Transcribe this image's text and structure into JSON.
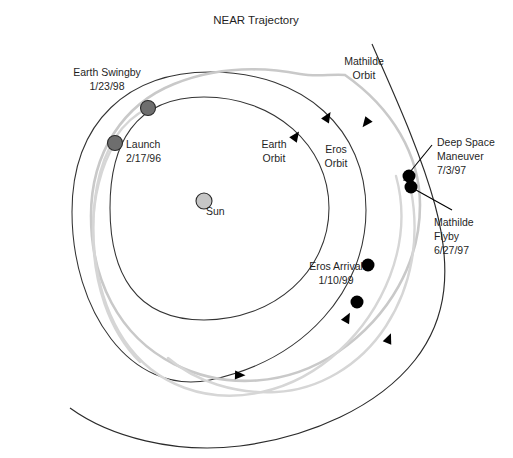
{
  "figure": {
    "title": "NEAR Trajectory",
    "width": 513,
    "height": 458,
    "background": "#ffffff"
  },
  "colors": {
    "orbit_line": "#2b2b2b",
    "trajectory_gray": "#c9c9c9",
    "body_marker": "#6e6e6e",
    "sun_marker": "#c6c6c6",
    "event_marker": "#000000",
    "text": "#1f1f1f"
  },
  "labels": {
    "earth_swingby": {
      "name": "Earth Swingby",
      "date": "1/23/98"
    },
    "launch": {
      "name": "Launch",
      "date": "2/17/96"
    },
    "sun": {
      "name": "Sun"
    },
    "earth_orbit": {
      "line1": "Earth",
      "line2": "Orbit"
    },
    "eros_orbit": {
      "line1": "Eros",
      "line2": "Orbit"
    },
    "mathilde_orbit": {
      "line1": "Mathilde",
      "line2": "Orbit"
    },
    "deep_space_maneuver": {
      "line1": "Deep Space",
      "line2": "Maneuver",
      "date": "7/3/97"
    },
    "mathilde_flyby": {
      "line1": "Mathilde",
      "line2": "Flyby",
      "date": "6/27/97"
    },
    "eros_arrival": {
      "name": "Eros Arrival",
      "date": "1/10/99"
    }
  },
  "markers": [
    {
      "id": "earth-swingby-marker",
      "label": "Earth Swingby",
      "x": 148,
      "y": 108,
      "r": 7.5,
      "style": "body"
    },
    {
      "id": "launch-marker",
      "label": "Launch",
      "x": 115,
      "y": 143,
      "r": 7.5,
      "style": "body"
    },
    {
      "id": "sun-marker",
      "label": "Sun",
      "x": 204,
      "y": 201,
      "r": 8.0,
      "style": "sun"
    },
    {
      "id": "deep-space-maneuver-marker",
      "label": "Deep Space Maneuver",
      "x": 409,
      "y": 176,
      "r": 6.5,
      "style": "event"
    },
    {
      "id": "mathilde-flyby-marker",
      "label": "Mathilde Flyby",
      "x": 411,
      "y": 187,
      "r": 6.5,
      "style": "event"
    },
    {
      "id": "eros-arrival-marker",
      "label": "Eros Arrival",
      "x": 368,
      "y": 265,
      "r": 6.5,
      "style": "event"
    },
    {
      "id": "trajectory-point-marker",
      "label": "Trajectory point",
      "x": 357,
      "y": 302,
      "r": 6.5,
      "style": "event"
    }
  ],
  "orbits": [
    {
      "id": "earth-orbit",
      "label": "Earth Orbit",
      "style": "dark"
    },
    {
      "id": "eros-orbit",
      "label": "Eros Orbit",
      "style": "dark"
    },
    {
      "id": "mathilde-orbit",
      "label": "Mathilde Orbit",
      "style": "dark"
    },
    {
      "id": "spacecraft-trajectory",
      "label": "NEAR spacecraft trajectory",
      "style": "gray"
    }
  ],
  "direction_arrows": [
    {
      "id": "arrow-earth-orbit-upper",
      "x": 293,
      "y": 140,
      "angle": -55
    },
    {
      "id": "arrow-eros-orbit-upper",
      "x": 325,
      "y": 121,
      "angle": -58
    },
    {
      "id": "arrow-trajectory-upper",
      "x": 369,
      "y": 119,
      "angle": 128
    },
    {
      "id": "arrow-trajectory-lower-right",
      "x": 387,
      "y": 343,
      "angle": -68
    },
    {
      "id": "arrow-eros-orbit-lower",
      "x": 345,
      "y": 322,
      "angle": -62
    },
    {
      "id": "arrow-earth-orbit-lower",
      "x": 235,
      "y": 375,
      "angle": 2
    }
  ]
}
